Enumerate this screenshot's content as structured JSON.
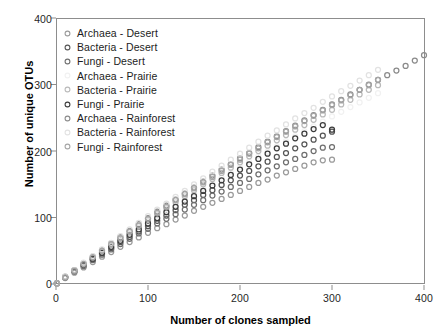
{
  "chart_data": {
    "type": "scatter",
    "title": "",
    "xlabel": "Number of clones sampled",
    "ylabel": "Number of unique OTUs",
    "xlim": [
      0,
      420
    ],
    "ylim": [
      0,
      400
    ],
    "xticks": [
      0,
      100,
      200,
      300,
      400
    ],
    "yticks": [
      0,
      100,
      200,
      300,
      400
    ],
    "grid": false,
    "legend_position": "top-left inside",
    "marker": "open-circle",
    "series": [
      {
        "name": "Archaea - Desert",
        "color": "#9a9a9a",
        "x": [
          1,
          10,
          20,
          30,
          40,
          50,
          60,
          70,
          80,
          90,
          100,
          110,
          120,
          130,
          140,
          150,
          160,
          170,
          180,
          190,
          200,
          210,
          220,
          230,
          240,
          250,
          260,
          270,
          280,
          290,
          300
        ],
        "y": [
          1,
          9,
          17,
          25,
          33,
          41,
          48,
          56,
          63,
          70,
          77,
          84,
          90,
          97,
          103,
          110,
          116,
          122,
          128,
          134,
          140,
          146,
          152,
          157,
          163,
          168,
          173,
          178,
          183,
          186,
          187
        ]
      },
      {
        "name": "Bacteria - Desert",
        "color": "#545454",
        "x": [
          1,
          10,
          20,
          30,
          40,
          50,
          60,
          70,
          80,
          90,
          100,
          110,
          120,
          130,
          140,
          150,
          160,
          170,
          180,
          190,
          200,
          210,
          220,
          230,
          240,
          250,
          260,
          270,
          280,
          290,
          300
        ],
        "y": [
          1,
          10,
          19,
          28,
          37,
          46,
          54,
          63,
          71,
          79,
          87,
          95,
          103,
          111,
          119,
          126,
          134,
          141,
          149,
          156,
          163,
          170,
          177,
          184,
          191,
          197,
          204,
          210,
          217,
          223,
          229
        ]
      },
      {
        "name": "Fungi - Desert",
        "color": "#6e6e6e",
        "x": [
          1,
          10,
          20,
          30,
          40,
          50,
          60,
          70,
          80,
          90,
          100,
          110,
          120,
          130,
          140,
          150,
          160,
          170,
          180,
          190,
          200,
          210,
          220,
          230,
          240,
          250,
          260,
          270,
          280,
          290,
          300
        ],
        "y": [
          1,
          10,
          19,
          27,
          36,
          44,
          52,
          60,
          68,
          76,
          83,
          91,
          98,
          105,
          112,
          119,
          126,
          133,
          139,
          146,
          152,
          158,
          165,
          171,
          177,
          183,
          188,
          194,
          200,
          205,
          206
        ]
      },
      {
        "name": "Archaea - Prairie",
        "color": "#f1f1f1",
        "x": [
          1,
          10,
          20,
          30,
          40,
          50,
          60,
          70,
          80,
          90,
          100,
          110,
          120,
          130,
          140,
          150,
          160,
          170,
          180,
          190,
          200,
          210,
          220,
          230,
          240,
          250,
          260,
          270,
          280,
          290,
          300,
          310,
          320,
          330,
          340,
          350
        ],
        "y": [
          1,
          10,
          20,
          29,
          39,
          48,
          57,
          66,
          75,
          84,
          93,
          102,
          110,
          119,
          127,
          136,
          144,
          152,
          160,
          168,
          176,
          184,
          192,
          199,
          207,
          215,
          222,
          230,
          237,
          244,
          252,
          259,
          266,
          273,
          280,
          287
        ]
      },
      {
        "name": "Bacteria - Prairie",
        "color": "#b9b9b9",
        "x": [
          1,
          10,
          20,
          30,
          40,
          50,
          60,
          70,
          80,
          90,
          100,
          110,
          120,
          130,
          140,
          150,
          160,
          170,
          180,
          190,
          200,
          210,
          220,
          230,
          240,
          250,
          260,
          270,
          280,
          290,
          300,
          310,
          320,
          330,
          340,
          350
        ],
        "y": [
          1,
          10,
          20,
          30,
          40,
          49,
          59,
          68,
          78,
          87,
          96,
          105,
          114,
          123,
          132,
          141,
          150,
          158,
          167,
          175,
          183,
          192,
          200,
          208,
          216,
          224,
          232,
          239,
          247,
          255,
          262,
          270,
          277,
          285,
          292,
          299
        ]
      },
      {
        "name": "Fungi - Prairie",
        "color": "#3b3b3b",
        "x": [
          1,
          10,
          20,
          30,
          40,
          50,
          60,
          70,
          80,
          90,
          100,
          110,
          120,
          130,
          140,
          150,
          160,
          170,
          180,
          190,
          200,
          210,
          220,
          230,
          240,
          250,
          260,
          270,
          280,
          290,
          300
        ],
        "y": [
          1,
          10,
          20,
          29,
          38,
          47,
          56,
          65,
          74,
          82,
          91,
          99,
          108,
          116,
          124,
          132,
          140,
          148,
          156,
          164,
          172,
          180,
          188,
          196,
          204,
          211,
          219,
          226,
          233,
          239,
          232
        ]
      },
      {
        "name": "Archaea - Rainforest",
        "color": "#8a8a8a",
        "x": [
          1,
          10,
          20,
          30,
          40,
          50,
          60,
          70,
          80,
          90,
          100,
          110,
          120,
          130,
          140,
          150,
          160,
          170,
          180,
          190,
          200,
          210,
          220,
          230,
          240,
          250,
          260,
          270,
          280,
          290,
          300,
          310,
          320,
          330,
          340,
          350,
          360,
          370,
          380,
          390,
          400
        ],
        "y": [
          1,
          11,
          21,
          31,
          41,
          51,
          61,
          71,
          80,
          90,
          99,
          109,
          118,
          127,
          136,
          145,
          154,
          163,
          172,
          180,
          189,
          197,
          206,
          214,
          222,
          230,
          238,
          246,
          254,
          262,
          270,
          277,
          285,
          292,
          300,
          307,
          314,
          321,
          328,
          336,
          344
        ]
      },
      {
        "name": "Bacteria - Rainforest",
        "color": "#e2e2e2",
        "x": [
          1,
          10,
          20,
          30,
          40,
          50,
          60,
          70,
          80,
          90,
          100,
          110,
          120,
          130,
          140,
          150,
          160,
          170,
          180,
          190,
          200,
          210,
          220,
          230,
          240,
          250,
          260,
          270,
          280,
          290,
          300,
          310,
          320,
          330,
          340,
          350
        ],
        "y": [
          1,
          11,
          21,
          32,
          42,
          52,
          62,
          72,
          82,
          92,
          102,
          112,
          121,
          131,
          140,
          150,
          159,
          169,
          178,
          187,
          196,
          205,
          214,
          223,
          231,
          240,
          249,
          257,
          265,
          274,
          282,
          290,
          298,
          306,
          314,
          322
        ]
      },
      {
        "name": "Fungi - Rainforest",
        "color": "#a5a5a5",
        "x": [
          1,
          10,
          20,
          30,
          40,
          50,
          60,
          70,
          80,
          90,
          100,
          110,
          120,
          130,
          140,
          150,
          160,
          170,
          180,
          190,
          200,
          210,
          220,
          230,
          240,
          250,
          260,
          270,
          280,
          290,
          300,
          310,
          320,
          330,
          340,
          350
        ],
        "y": [
          1,
          10,
          20,
          30,
          40,
          50,
          60,
          69,
          79,
          88,
          98,
          107,
          116,
          126,
          135,
          144,
          153,
          161,
          170,
          179,
          187,
          196,
          204,
          213,
          221,
          229,
          237,
          245,
          253,
          261,
          269,
          276,
          284,
          292,
          299,
          307
        ]
      }
    ]
  },
  "axes": {
    "x_title": "Number of clones sampled",
    "y_title": "Number of unique OTUs",
    "x_ticks": [
      "0",
      "100",
      "200",
      "300",
      "400"
    ],
    "y_ticks": [
      "0",
      "100",
      "200",
      "300",
      "400"
    ]
  },
  "legend": {
    "items": [
      {
        "label": "Archaea - Desert",
        "color": "#9a9a9a"
      },
      {
        "label": "Bacteria - Desert",
        "color": "#545454"
      },
      {
        "label": "Fungi - Desert",
        "color": "#6e6e6e"
      },
      {
        "label": "Archaea - Prairie",
        "color": "#f1f1f1"
      },
      {
        "label": "Bacteria - Prairie",
        "color": "#b9b9b9"
      },
      {
        "label": "Fungi - Prairie",
        "color": "#3b3b3b"
      },
      {
        "label": "Archaea - Rainforest",
        "color": "#8a8a8a"
      },
      {
        "label": "Bacteria - Rainforest",
        "color": "#e2e2e2"
      },
      {
        "label": "Fungi - Rainforest",
        "color": "#a5a5a5"
      }
    ]
  },
  "style": {
    "frame_color": "#8d8d8d",
    "text_color": "#1a1a1a",
    "background": "#ffffff"
  }
}
